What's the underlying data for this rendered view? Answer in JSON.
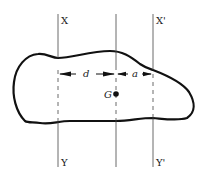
{
  "diagram": {
    "colors": {
      "stroke": "#111111",
      "axis": "#444444",
      "background": "#ffffff"
    },
    "axes": [
      {
        "id": "XY",
        "top_label": "X",
        "bottom_label": "Y",
        "x": 58
      },
      {
        "id": "centroid",
        "top_label": "",
        "bottom_label": "",
        "x": 116
      },
      {
        "id": "X'Y'",
        "top_label": "X'",
        "bottom_label": "Y'",
        "x": 153
      }
    ],
    "centroid": {
      "label": "G",
      "x": 116,
      "y": 94
    },
    "dimensions": [
      {
        "label": "d",
        "from_axis": "XY",
        "to_axis": "centroid"
      },
      {
        "label": "a",
        "from_axis": "centroid",
        "to_axis": "X'Y'"
      }
    ]
  }
}
